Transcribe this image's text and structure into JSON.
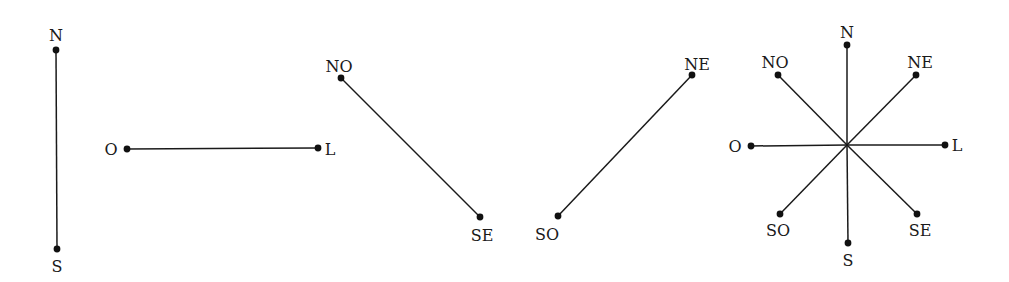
{
  "diagram": {
    "title": "",
    "colors": {
      "line": "#1a1a1a",
      "dot": "#111111",
      "background": "#ffffff"
    },
    "panels": [
      {
        "id": "north-south",
        "segments": [
          {
            "from": [
              56,
              50
            ],
            "to": [
              57,
              249
            ]
          }
        ],
        "points": [
          {
            "label": "N",
            "dot": [
              56,
              50
            ],
            "text": [
              56,
              41
            ]
          },
          {
            "label": "S",
            "dot": [
              57,
              249
            ],
            "text": [
              57,
              272
            ]
          }
        ]
      },
      {
        "id": "west-east",
        "segments": [
          {
            "from": [
              127,
              149
            ],
            "to": [
              318,
              148
            ]
          }
        ],
        "points": [
          {
            "label": "O",
            "dot": [
              127,
              149
            ],
            "text": [
              111,
              155
            ]
          },
          {
            "label": "L",
            "dot": [
              318,
              148
            ],
            "text": [
              330,
              155
            ]
          }
        ]
      },
      {
        "id": "northwest-southeast",
        "segments": [
          {
            "from": [
              341,
              78
            ],
            "to": [
              480,
              217
            ]
          }
        ],
        "points": [
          {
            "label": "NO",
            "dot": [
              341,
              78
            ],
            "text": [
              339,
              72
            ]
          },
          {
            "label": "SE",
            "dot": [
              480,
              217
            ],
            "text": [
              482,
              241
            ]
          }
        ]
      },
      {
        "id": "northeast-southwest",
        "segments": [
          {
            "from": [
              692,
              75
            ],
            "to": [
              558,
              216
            ]
          }
        ],
        "points": [
          {
            "label": "NE",
            "dot": [
              692,
              75
            ],
            "text": [
              697,
              70
            ]
          },
          {
            "label": "SO",
            "dot": [
              558,
              216
            ],
            "text": [
              547,
              240
            ]
          }
        ]
      },
      {
        "id": "compass-rose",
        "center": [
          847,
          145
        ],
        "points": [
          {
            "label": "N",
            "dot": [
              847,
              45
            ],
            "text": [
              847,
              38
            ]
          },
          {
            "label": "NE",
            "dot": [
              916,
              75
            ],
            "text": [
              920,
              68
            ]
          },
          {
            "label": "L",
            "dot": [
              945,
              145
            ],
            "text": [
              957,
              151
            ]
          },
          {
            "label": "SE",
            "dot": [
              917,
              214
            ],
            "text": [
              920,
              236
            ]
          },
          {
            "label": "S",
            "dot": [
              848,
              243
            ],
            "text": [
              848,
              266
            ]
          },
          {
            "label": "SO",
            "dot": [
              780,
              214
            ],
            "text": [
              778,
              236
            ]
          },
          {
            "label": "O",
            "dot": [
              751,
              146
            ],
            "text": [
              735,
              152
            ]
          },
          {
            "label": "NO",
            "dot": [
              778,
              75
            ],
            "text": [
              775,
              68
            ]
          }
        ]
      }
    ]
  }
}
